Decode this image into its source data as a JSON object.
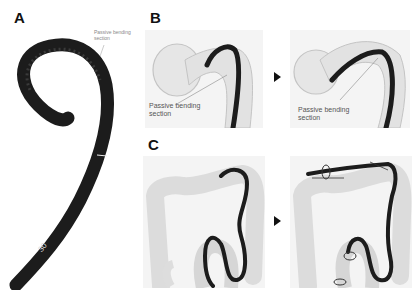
{
  "figure": {
    "panels": [
      {
        "id": "A",
        "letter": "A",
        "description": "Colonoscope insertion tube with curled distal end",
        "callout": {
          "line1": "Passive bending",
          "line2": "section"
        },
        "scope_marking": "30"
      },
      {
        "id": "B",
        "letter": "B",
        "description": "Passive bending section navigating sigmoid flexure (before/after)",
        "subpanels": [
          {
            "state": "before",
            "callout": {
              "line1": "Passive bending",
              "line2": "section"
            }
          },
          {
            "state": "after",
            "callout": {
              "line1": "Passive bending",
              "line2": "section"
            }
          }
        ],
        "transition_arrow": "right-triangle"
      },
      {
        "id": "C",
        "letter": "C",
        "description": "Colonoscope advancing through whole colon with loop formation (before/after)",
        "subpanels": [
          {
            "state": "before"
          },
          {
            "state": "after"
          }
        ],
        "transition_arrow": "right-triangle"
      }
    ],
    "colors": {
      "scope": "#1a1a1a",
      "colon": "#d8d8d8",
      "colon_outline": "#bdbdbd",
      "background": "#ffffff",
      "label_text": "#555555"
    }
  }
}
